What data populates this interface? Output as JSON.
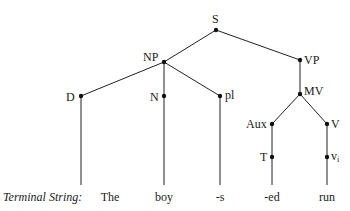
{
  "diagram": {
    "type": "phrase-structure-tree",
    "caption_label": "Terminal String:",
    "nodes": {
      "S": {
        "label": "S"
      },
      "NP": {
        "label": "NP"
      },
      "VP": {
        "label": "VP"
      },
      "D": {
        "label": "D"
      },
      "N": {
        "label": "N"
      },
      "pl": {
        "label": "pl"
      },
      "MV": {
        "label": "MV"
      },
      "Aux": {
        "label": "Aux"
      },
      "V": {
        "label": "V"
      },
      "T": {
        "label": "T"
      },
      "vi": {
        "label": "v",
        "subscript": "i"
      }
    },
    "edges": [
      [
        "S",
        "NP"
      ],
      [
        "S",
        "VP"
      ],
      [
        "NP",
        "D"
      ],
      [
        "NP",
        "N"
      ],
      [
        "NP",
        "pl"
      ],
      [
        "VP",
        "MV"
      ],
      [
        "MV",
        "Aux"
      ],
      [
        "MV",
        "V"
      ],
      [
        "Aux",
        "T"
      ],
      [
        "V",
        "vi"
      ]
    ],
    "terminals": [
      "The",
      "boy",
      "-s",
      "-ed",
      "run"
    ]
  },
  "colors": {
    "line": "#222222",
    "node": "#111111",
    "text": "#1a1a1a",
    "background": "#ffffff"
  }
}
